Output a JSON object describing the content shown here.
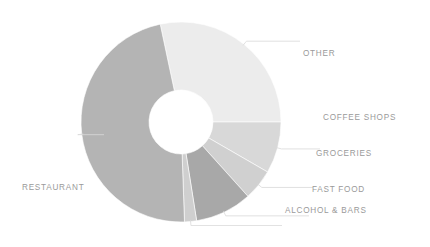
{
  "chart_data": {
    "type": "pie",
    "variant": "donut",
    "title": "",
    "xlabel": "",
    "ylabel": "",
    "legend_position": "outside-labels",
    "grid": false,
    "hole_ratio": 0.32,
    "start_angle_deg": -12,
    "direction": "clockwise",
    "units": "percent",
    "categories": [
      "OTHER",
      "COFFEE SHOPS",
      "GROCERIES",
      "FAST FOOD",
      "ALCOHOL & BARS",
      "RESTAURANT"
    ],
    "values": [
      28.3,
      8.3,
      5.0,
      9.2,
      1.9,
      47.3
    ],
    "angles_deg": [
      102,
      30,
      18,
      33,
      7,
      170
    ],
    "colors": [
      "#ececec",
      "#d8d8d8",
      "#d0d0d0",
      "#a8a8a8",
      "#cfcfcf",
      "#b4b4b4"
    ],
    "slices": [
      {
        "label": "OTHER",
        "value": 28.3,
        "angle_deg": 102,
        "color": "#ececec"
      },
      {
        "label": "COFFEE SHOPS",
        "value": 8.3,
        "angle_deg": 30,
        "color": "#d8d8d8"
      },
      {
        "label": "GROCERIES",
        "value": 5.0,
        "angle_deg": 18,
        "color": "#d0d0d0"
      },
      {
        "label": "FAST FOOD",
        "value": 9.2,
        "angle_deg": 33,
        "color": "#a8a8a8"
      },
      {
        "label": "ALCOHOL & BARS",
        "value": 1.9,
        "angle_deg": 7,
        "color": "#cfcfcf"
      },
      {
        "label": "RESTAURANT",
        "value": 47.3,
        "angle_deg": 170,
        "color": "#b4b4b4"
      }
    ]
  },
  "figure": {
    "background": "#ffffff",
    "label_color": "#9a9a9a",
    "leader_color": "#d9d9d9",
    "center_x": 181,
    "center_y": 122,
    "outer_radius": 100,
    "inner_radius": 32
  },
  "labels": {
    "other": "OTHER",
    "coffee_shops": "COFFEE SHOPS",
    "groceries": "GROCERIES",
    "fast_food": "FAST FOOD",
    "alcohol_bars": "ALCOHOL & BARS",
    "restaurant": "RESTAURANT"
  }
}
